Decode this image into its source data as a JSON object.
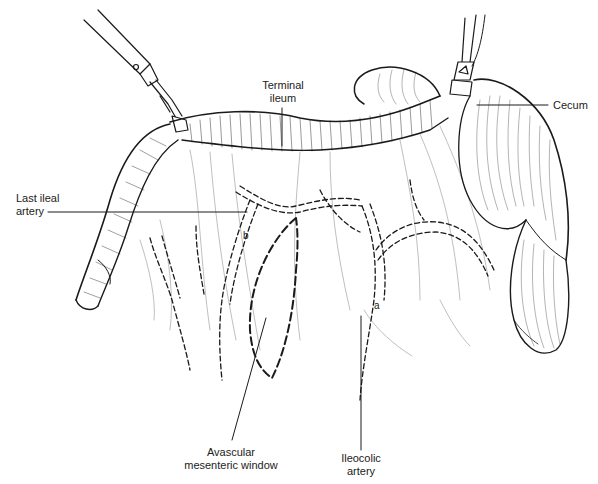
{
  "figure": {
    "type": "surgical illustration",
    "labels": {
      "terminal_ileum": "Terminal ileum",
      "terminal_ileum_l1": "Terminal",
      "terminal_ileum_l2": "ileum",
      "cecum": "Cecum",
      "last_ileal_artery_l1": "Last ileal",
      "last_ileal_artery_l2": "artery",
      "avascular_window_l1": "Avascular",
      "avascular_window_l2": "mesenteric window",
      "ileocolic_artery_l1": "Ileocolic",
      "ileocolic_artery_l2": "artery",
      "marker_a": "a",
      "marker_b": "b"
    },
    "colors": {
      "ink": "#1a1a1a",
      "background": "#ffffff"
    }
  }
}
